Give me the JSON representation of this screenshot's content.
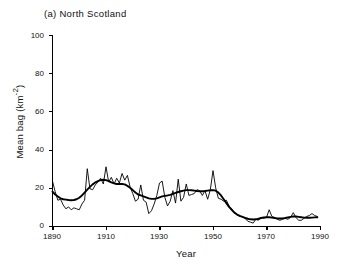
{
  "figure": {
    "panel_label": "(a)  North Scotland"
  },
  "axis": {
    "y_title": "Mean bag (km",
    "y_title_exponent": "-2",
    "y_title_close": ")",
    "x_title": "Year",
    "y_ticks": [
      "0",
      "20",
      "40",
      "60",
      "80",
      "100"
    ],
    "x_ticks": [
      "1890",
      "1910",
      "1930",
      "1950",
      "1970",
      "1990"
    ]
  },
  "chart_data": {
    "type": "line",
    "title": "(a)  North Scotland",
    "xlabel": "Year",
    "ylabel": "Mean bag (km-2)",
    "xlim": [
      1890,
      1990
    ],
    "ylim": [
      0,
      100
    ],
    "xticks": [
      1890,
      1910,
      1930,
      1950,
      1970,
      1990
    ],
    "yticks": [
      0,
      20,
      40,
      60,
      80,
      100
    ],
    "grid": false,
    "legend": "none",
    "x": [
      1890,
      1891,
      1892,
      1893,
      1894,
      1895,
      1896,
      1897,
      1898,
      1899,
      1900,
      1901,
      1902,
      1903,
      1904,
      1905,
      1906,
      1907,
      1908,
      1909,
      1910,
      1911,
      1912,
      1913,
      1914,
      1915,
      1916,
      1917,
      1918,
      1919,
      1920,
      1921,
      1922,
      1923,
      1924,
      1925,
      1926,
      1927,
      1928,
      1929,
      1930,
      1931,
      1932,
      1933,
      1934,
      1935,
      1936,
      1937,
      1938,
      1939,
      1940,
      1941,
      1942,
      1943,
      1944,
      1945,
      1946,
      1947,
      1948,
      1949,
      1950,
      1951,
      1952,
      1953,
      1954,
      1955,
      1956,
      1957,
      1958,
      1959,
      1960,
      1961,
      1962,
      1963,
      1964,
      1965,
      1966,
      1967,
      1968,
      1969,
      1970,
      1971,
      1972,
      1973,
      1974,
      1975,
      1976,
      1977,
      1978,
      1979,
      1980,
      1981,
      1982,
      1983,
      1984,
      1985,
      1986,
      1987,
      1988,
      1989
    ],
    "series": [
      {
        "name": "Annual mean bag",
        "style": "thin",
        "values": [
          23.5,
          18.0,
          13.5,
          14.0,
          11.0,
          9.0,
          10.0,
          8.5,
          9.5,
          9.0,
          8.5,
          11.5,
          13.5,
          30.0,
          19.5,
          19.0,
          21.5,
          23.0,
          25.0,
          22.0,
          31.0,
          23.0,
          25.5,
          22.0,
          25.0,
          22.5,
          27.5,
          24.0,
          26.5,
          20.5,
          17.0,
          13.0,
          14.0,
          21.5,
          13.5,
          12.5,
          6.5,
          8.0,
          11.5,
          16.0,
          22.5,
          23.5,
          15.0,
          10.5,
          13.0,
          18.5,
          12.0,
          24.5,
          13.0,
          15.0,
          22.0,
          16.0,
          16.5,
          17.0,
          19.0,
          18.5,
          16.0,
          18.5,
          14.0,
          19.0,
          29.0,
          20.0,
          14.5,
          14.0,
          13.0,
          13.5,
          10.5,
          8.5,
          7.0,
          6.0,
          5.0,
          5.0,
          4.0,
          2.5,
          2.0,
          1.5,
          3.5,
          3.0,
          4.5,
          4.0,
          4.5,
          8.5,
          5.0,
          4.5,
          3.5,
          3.0,
          3.5,
          4.0,
          3.5,
          4.5,
          7.0,
          4.5,
          3.0,
          3.0,
          4.0,
          5.0,
          5.5,
          6.5,
          5.5,
          5.0
        ]
      },
      {
        "name": "Smoothed trend",
        "style": "thick",
        "values": [
          18.0,
          16.5,
          15.5,
          14.5,
          14.0,
          13.8,
          13.6,
          13.5,
          13.6,
          14.0,
          14.8,
          16.0,
          17.5,
          19.0,
          20.5,
          21.8,
          22.8,
          23.5,
          24.0,
          24.2,
          24.0,
          23.5,
          22.8,
          22.3,
          22.0,
          22.0,
          22.0,
          21.8,
          21.0,
          20.0,
          18.8,
          17.5,
          16.5,
          16.0,
          15.5,
          15.0,
          14.5,
          14.2,
          14.2,
          14.5,
          15.0,
          15.5,
          15.8,
          16.0,
          16.3,
          16.8,
          17.3,
          17.8,
          18.2,
          18.5,
          18.8,
          18.8,
          18.7,
          18.5,
          18.3,
          18.2,
          18.2,
          18.3,
          18.5,
          18.7,
          18.8,
          18.5,
          17.5,
          16.0,
          14.0,
          12.0,
          10.0,
          8.5,
          7.0,
          6.0,
          5.3,
          4.8,
          4.3,
          3.8,
          3.5,
          3.4,
          3.5,
          3.8,
          4.2,
          4.5,
          4.6,
          4.6,
          4.4,
          4.2,
          4.0,
          3.9,
          4.0,
          4.2,
          4.5,
          4.8,
          5.0,
          5.0,
          4.8,
          4.6,
          4.4,
          4.3,
          4.3,
          4.4,
          4.5,
          4.6
        ]
      }
    ]
  }
}
